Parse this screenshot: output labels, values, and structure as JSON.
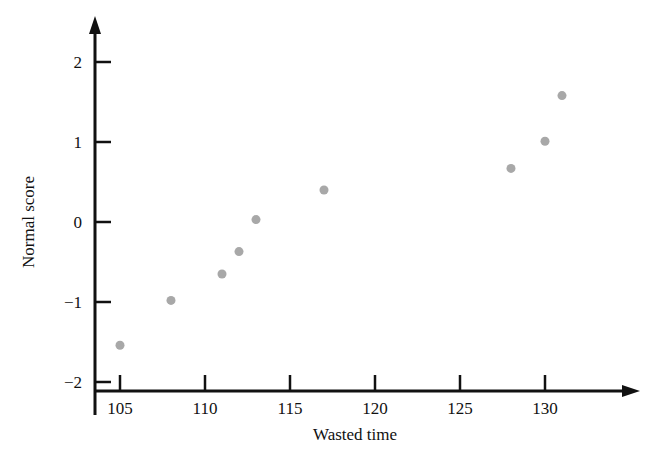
{
  "chart_data": {
    "type": "scatter",
    "title": "",
    "xlabel": "Wasted time",
    "ylabel": "Normal score",
    "xlim": [
      103.2,
      133.5
    ],
    "ylim": [
      -2.35,
      2.45
    ],
    "xticks": [
      105,
      110,
      115,
      120,
      125,
      130
    ],
    "yticks": [
      2,
      1,
      0,
      -1,
      -2
    ],
    "xtick_labels": [
      "105",
      "110",
      "115",
      "120",
      "125",
      "130"
    ],
    "ytick_labels": [
      "2",
      "1",
      "0",
      "−1",
      "−2"
    ],
    "grid": false,
    "legend": null,
    "marker": {
      "shape": "circle",
      "color": "#a8a8a8",
      "size_px": 9
    },
    "axis_color": "#111111",
    "points": [
      {
        "x": 105,
        "y": -1.54
      },
      {
        "x": 108,
        "y": -0.98
      },
      {
        "x": 111,
        "y": -0.65
      },
      {
        "x": 112,
        "y": -0.37
      },
      {
        "x": 113,
        "y": 0.03
      },
      {
        "x": 117,
        "y": 0.4
      },
      {
        "x": 128,
        "y": 0.67
      },
      {
        "x": 130,
        "y": 1.01
      },
      {
        "x": 131,
        "y": 1.58
      }
    ]
  }
}
